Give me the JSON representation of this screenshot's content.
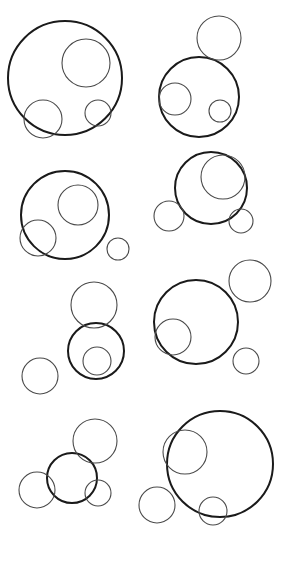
{
  "canvas": {
    "width": 284,
    "height": 564,
    "background_color": "#ffffff"
  },
  "figure": {
    "title": "",
    "stroke_color_primary": "#1a1a1a",
    "stroke_color_secondary": "#4a4a4a",
    "stroke_width_primary": 2,
    "stroke_width_secondary": 1.1,
    "fill": "none"
  },
  "chart_data": {
    "type": "scatter",
    "title": "",
    "xlabel": "",
    "ylabel": "",
    "xlim": [
      0,
      284
    ],
    "ylim": [
      0,
      564
    ],
    "grid": false,
    "legend": "none",
    "groups": [
      {
        "name": "group-1",
        "row": 1,
        "column": "left",
        "circles": [
          {
            "role": "main",
            "cx": 65,
            "cy": 78,
            "r": 57
          },
          {
            "role": "sub-1",
            "cx": 86,
            "cy": 63,
            "r": 24
          },
          {
            "role": "sub-2",
            "cx": 43,
            "cy": 119,
            "r": 19
          },
          {
            "role": "sub-3",
            "cx": 98,
            "cy": 113,
            "r": 13
          }
        ]
      },
      {
        "name": "group-2",
        "row": 1,
        "column": "right",
        "circles": [
          {
            "role": "main",
            "cx": 199,
            "cy": 97,
            "r": 40
          },
          {
            "role": "sub-1",
            "cx": 219,
            "cy": 38,
            "r": 22
          },
          {
            "role": "sub-2",
            "cx": 175,
            "cy": 99,
            "r": 16
          },
          {
            "role": "sub-3",
            "cx": 220,
            "cy": 111,
            "r": 11
          }
        ]
      },
      {
        "name": "group-3",
        "row": 2,
        "column": "left",
        "circles": [
          {
            "role": "main",
            "cx": 65,
            "cy": 215,
            "r": 44
          },
          {
            "role": "sub-1",
            "cx": 78,
            "cy": 205,
            "r": 20
          },
          {
            "role": "sub-2",
            "cx": 38,
            "cy": 238,
            "r": 18
          },
          {
            "role": "sub-3",
            "cx": 118,
            "cy": 249,
            "r": 11
          }
        ]
      },
      {
        "name": "group-4",
        "row": 2,
        "column": "right",
        "circles": [
          {
            "role": "main",
            "cx": 211,
            "cy": 188,
            "r": 36
          },
          {
            "role": "sub-1",
            "cx": 223,
            "cy": 177,
            "r": 22
          },
          {
            "role": "sub-2",
            "cx": 169,
            "cy": 216,
            "r": 15
          },
          {
            "role": "sub-3",
            "cx": 241,
            "cy": 221,
            "r": 12
          }
        ]
      },
      {
        "name": "group-5",
        "row": 3,
        "column": "left",
        "circles": [
          {
            "role": "main",
            "cx": 96,
            "cy": 351,
            "r": 28
          },
          {
            "role": "sub-1",
            "cx": 94,
            "cy": 305,
            "r": 23
          },
          {
            "role": "sub-2",
            "cx": 40,
            "cy": 376,
            "r": 18
          },
          {
            "role": "sub-3",
            "cx": 97,
            "cy": 361,
            "r": 14
          }
        ]
      },
      {
        "name": "group-6",
        "row": 3,
        "column": "right",
        "circles": [
          {
            "role": "main",
            "cx": 196,
            "cy": 322,
            "r": 42
          },
          {
            "role": "sub-1",
            "cx": 250,
            "cy": 281,
            "r": 21
          },
          {
            "role": "sub-2",
            "cx": 173,
            "cy": 337,
            "r": 18
          },
          {
            "role": "sub-3",
            "cx": 246,
            "cy": 361,
            "r": 13
          }
        ]
      },
      {
        "name": "group-7",
        "row": 4,
        "column": "left",
        "circles": [
          {
            "role": "main",
            "cx": 72,
            "cy": 478,
            "r": 25
          },
          {
            "role": "sub-1",
            "cx": 95,
            "cy": 441,
            "r": 22
          },
          {
            "role": "sub-2",
            "cx": 37,
            "cy": 490,
            "r": 18
          },
          {
            "role": "sub-3",
            "cx": 98,
            "cy": 493,
            "r": 13
          }
        ]
      },
      {
        "name": "group-8",
        "row": 4,
        "column": "right",
        "circles": [
          {
            "role": "main",
            "cx": 220,
            "cy": 464,
            "r": 53
          },
          {
            "role": "sub-1",
            "cx": 185,
            "cy": 452,
            "r": 22
          },
          {
            "role": "sub-2",
            "cx": 157,
            "cy": 505,
            "r": 18
          },
          {
            "role": "sub-3",
            "cx": 213,
            "cy": 511,
            "r": 14
          }
        ]
      }
    ]
  }
}
